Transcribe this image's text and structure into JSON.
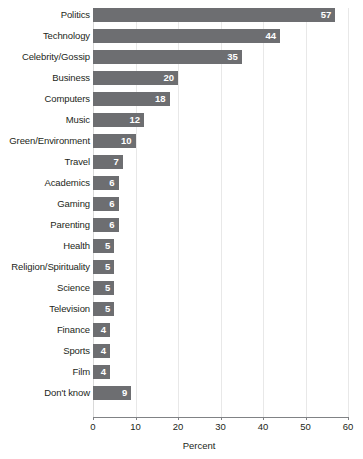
{
  "chart_data": {
    "type": "bar",
    "orientation": "horizontal",
    "title": "",
    "xlabel": "Percent",
    "ylabel": "",
    "xlim": [
      0,
      60
    ],
    "xticks": [
      0,
      10,
      20,
      30,
      40,
      50,
      60
    ],
    "grid": true,
    "legend": false,
    "bar_color": "#6d6e71",
    "value_label_color": "#ffffff",
    "gridline_color": "#e8e8e8",
    "axis_color": "#808285",
    "categories": [
      "Politics",
      "Technology",
      "Celebrity/Gossip",
      "Business",
      "Computers",
      "Music",
      "Green/Environment",
      "Travel",
      "Academics",
      "Gaming",
      "Parenting",
      "Health",
      "Religion/Spirituality",
      "Science",
      "Television",
      "Finance",
      "Sports",
      "Film",
      "Don't know"
    ],
    "values": [
      57,
      44,
      35,
      20,
      18,
      12,
      10,
      7,
      6,
      6,
      6,
      5,
      5,
      5,
      5,
      4,
      4,
      4,
      9
    ]
  }
}
